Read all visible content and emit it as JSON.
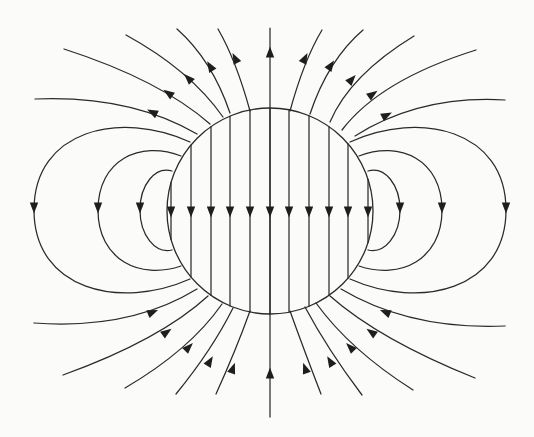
{
  "figure": {
    "title": "Field lines of a uniformly magnetized sphere",
    "background": "#fbfbfa",
    "stroke_color": "#2a2a2a",
    "arrow_color": "#1e1e1e",
    "sphere": {
      "cx": 270,
      "cy": 211,
      "r": 103
    },
    "interior_lines": {
      "x": [
        171,
        191,
        211,
        230,
        250,
        270,
        289,
        309,
        329,
        348,
        368
      ],
      "arrow_y": 212,
      "direction": "down"
    },
    "exterior_lines": [
      {
        "name": "top-axis",
        "d": "M270,313 L270,28",
        "arrow": [
          270,
          52,
          270,
          40
        ]
      },
      {
        "name": "top-left-1",
        "d": "M250,111 Q236,60 218,29",
        "arrow": [
          235,
          58,
          230,
          48
        ]
      },
      {
        "name": "top-left-2",
        "d": "M230,113 Q212,60 177,29",
        "arrow": [
          210,
          66,
          204,
          56
        ]
      },
      {
        "name": "top-left-3",
        "d": "M223,117 Q190,70 126,35",
        "arrow": [
          188,
          78,
          180,
          70
        ]
      },
      {
        "name": "top-left-4",
        "d": "M210,124 Q160,80 64,49",
        "arrow": [
          168,
          93,
          158,
          86
        ]
      },
      {
        "name": "top-left-5",
        "d": "M197,134 Q130,95 35,99",
        "arrow": [
          152,
          112,
          140,
          106
        ]
      },
      {
        "name": "top-right-1",
        "d": "M290,111 Q304,60 322,30",
        "arrow": [
          305,
          58,
          310,
          48
        ]
      },
      {
        "name": "top-right-2",
        "d": "M310,114 Q328,60 363,30",
        "arrow": [
          331,
          65,
          337,
          56
        ]
      },
      {
        "name": "top-right-3",
        "d": "M330,122 Q350,75 414,36",
        "arrow": [
          352,
          79,
          360,
          70
        ]
      },
      {
        "name": "top-right-4",
        "d": "M342,130 Q380,80 476,50",
        "arrow": [
          373,
          94,
          383,
          87
        ]
      },
      {
        "name": "top-right-5",
        "d": "M355,136 Q420,95 505,100",
        "arrow": [
          387,
          115,
          399,
          109
        ]
      },
      {
        "name": "bottom-axis",
        "d": "M270,417 L270,313",
        "arrow": [
          270,
          373,
          270,
          361
        ]
      },
      {
        "name": "bottom-left-1",
        "d": "M216,394 Q236,350 250,311",
        "arrow": [
          233,
          368,
          237,
          357
        ]
      },
      {
        "name": "bottom-left-2",
        "d": "M176,394 Q212,350 233,308",
        "arrow": [
          210,
          361,
          216,
          351
        ]
      },
      {
        "name": "bottom-left-3",
        "d": "M125,388 Q190,350 222,304",
        "arrow": [
          189,
          347,
          197,
          339
        ]
      },
      {
        "name": "bottom-left-4",
        "d": "M63,375 Q160,340 208,296",
        "arrow": [
          167,
          332,
          177,
          325
        ]
      },
      {
        "name": "bottom-left-5",
        "d": "M34,323 Q130,330 197,289",
        "arrow": [
          153,
          312,
          165,
          307
        ]
      },
      {
        "name": "bottom-right-1",
        "d": "M321,394 Q304,350 290,311",
        "arrow": [
          305,
          368,
          301,
          357
        ]
      },
      {
        "name": "bottom-right-2",
        "d": "M362,395 Q328,350 305,307",
        "arrow": [
          330,
          361,
          324,
          351
        ]
      },
      {
        "name": "bottom-right-3",
        "d": "M413,390 Q350,350 316,303",
        "arrow": [
          350,
          347,
          342,
          339
        ]
      },
      {
        "name": "bottom-right-4",
        "d": "M475,378 Q380,340 330,296",
        "arrow": [
          371,
          332,
          361,
          325
        ]
      },
      {
        "name": "bottom-right-5",
        "d": "M505,326 Q410,330 341,289",
        "arrow": [
          385,
          312,
          373,
          307
        ]
      }
    ],
    "loops": [
      {
        "name": "left-outer",
        "d": "M190,142 C120,110 34,130 34,210 C34,290 120,310 190,279",
        "arrow": [
          34,
          208,
          34,
          216
        ]
      },
      {
        "name": "left-middle",
        "d": "M181,156 C140,140 98,160 98,210 C98,260 140,280 181,266",
        "arrow": [
          98,
          208,
          98,
          216
        ]
      },
      {
        "name": "left-inner",
        "d": "M172,171 C155,166 140,185 140,210 C140,235 155,254 172,250",
        "arrow": [
          140,
          208,
          140,
          216
        ]
      },
      {
        "name": "right-outer",
        "d": "M350,142 C420,110 506,130 506,210 C506,290 420,310 350,279",
        "arrow": [
          506,
          208,
          506,
          216
        ]
      },
      {
        "name": "right-middle",
        "d": "M359,156 C400,140 442,160 442,210 C442,260 400,280 359,266",
        "arrow": [
          442,
          208,
          442,
          216
        ]
      },
      {
        "name": "right-inner",
        "d": "M368,171 C385,166 400,185 400,210 C400,235 385,254 368,250",
        "arrow": [
          400,
          208,
          400,
          216
        ]
      }
    ]
  }
}
